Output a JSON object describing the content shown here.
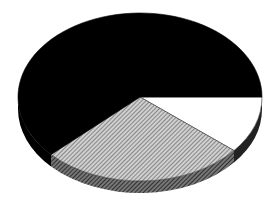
{
  "chart_data": {
    "type": "pie",
    "style": "3d-pie",
    "title": "",
    "legend": "none",
    "slices": [
      {
        "label": "",
        "value": 11,
        "fill": "white",
        "color": "#ffffff"
      },
      {
        "label": "",
        "value": 27,
        "fill": "hatched-gray",
        "color": "#9a9a9a"
      },
      {
        "label": "",
        "value": 62,
        "fill": "black",
        "color": "#000000"
      }
    ],
    "start_angle_deg": 0,
    "direction": "clockwise-on-screen"
  },
  "geometry": {
    "cx": 140,
    "cy": 97,
    "rx": 122,
    "ry": 84,
    "depth": 12
  }
}
